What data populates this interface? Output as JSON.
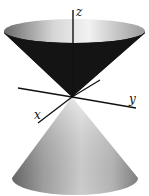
{
  "figure": {
    "axes": {
      "x_label": "x",
      "y_label": "y",
      "z_label": "z"
    },
    "colors": {
      "upper_cone_inner": "#111111",
      "upper_rim_light": "#e8e8e8",
      "lower_cone_light": "#d8d8d8",
      "lower_cone_dark": "#7a7a7a",
      "axis": "#111111"
    }
  }
}
